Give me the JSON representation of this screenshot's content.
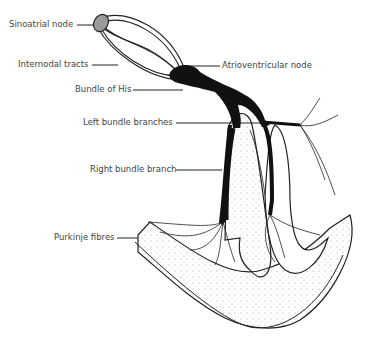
{
  "diagram": {
    "labels": [
      {
        "id": "sa",
        "text": "Sinoatrial node"
      },
      {
        "id": "internodal",
        "text": "Internodal tracts"
      },
      {
        "id": "his",
        "text": "Bundle of His"
      },
      {
        "id": "lbb",
        "text": "Left bundle branches"
      },
      {
        "id": "rbb",
        "text": "Right bundle branch"
      },
      {
        "id": "purkinje",
        "text": "Purkinje fibres"
      },
      {
        "id": "av",
        "text": "Atrioventricular node"
      }
    ],
    "colors": {
      "ink": "#111111",
      "node": "#9a9a9a",
      "label": "#444444",
      "stipple": "#888888"
    }
  }
}
